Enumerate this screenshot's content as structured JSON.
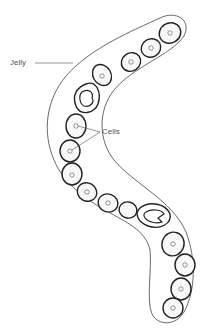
{
  "diagram": {
    "labels": {
      "jelly": "Jelly",
      "cells": "Cells"
    },
    "colors": {
      "outline": "#222222",
      "sheath": "#444444",
      "leader": "#666666",
      "label": "#555555",
      "stipple": "#9a9a9a",
      "background": "#ffffff"
    },
    "cell_count": 15,
    "special_cells": 2
  }
}
